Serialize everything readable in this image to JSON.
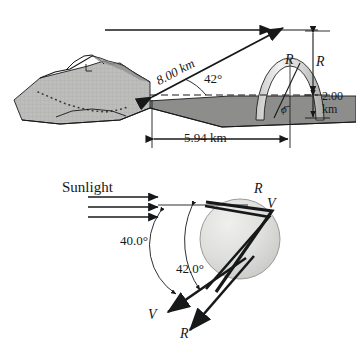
{
  "figure": {
    "panels": [
      {
        "name": "landscape-rainbow-panel",
        "labels": {
          "slant_distance": "8.00 km",
          "elevation_angle": "42°",
          "horizontal_distance": "5.94 km",
          "rainbow_height": "R",
          "rainbow_radius": "R",
          "base_height": "2.00",
          "base_height_unit": "km",
          "phi_angle": "ϕ"
        },
        "colors": {
          "ink": "#17181a",
          "terrain_fill": "#b9b9b7",
          "ground_fill": "#8d8d8b",
          "arc_fill": "#dcdcda"
        }
      },
      {
        "name": "raindrop-refraction-panel",
        "labels": {
          "sunlight": "Sunlight",
          "angle_violet": "40.0°",
          "angle_red": "42.0°",
          "ray_red_in": "R",
          "ray_violet_in": "V",
          "ray_violet_out": "V",
          "ray_red_out": "R"
        },
        "colors": {
          "ink": "#17181a",
          "drop_fill": "#d9d9d7"
        }
      }
    ]
  }
}
